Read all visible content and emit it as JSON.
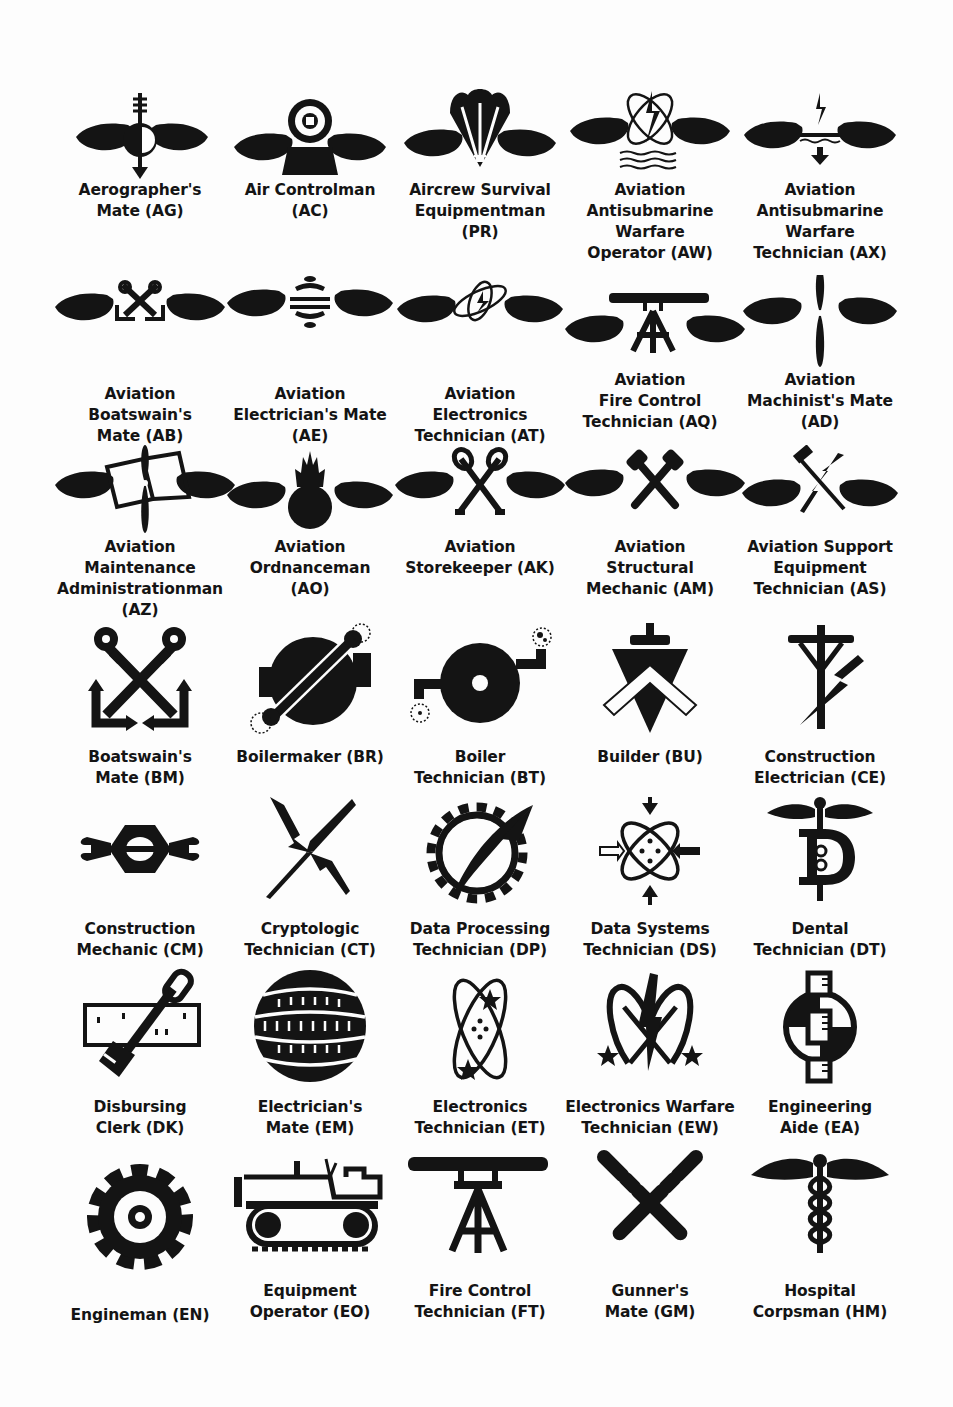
{
  "page": {
    "background": "#fdfdfd",
    "ink": "#141414",
    "rows": [
      {
        "items": [
          {
            "icon": "aerographers-mate-icon",
            "label": "Aerographer's\nMate (AG)",
            "rating": "AG"
          },
          {
            "icon": "air-controlman-icon",
            "label": "Air Controlman\n(AC)",
            "rating": "AC"
          },
          {
            "icon": "aircrew-survival-equipmentman-icon",
            "label": "Aircrew Survival\nEquipmentman\n(PR)",
            "rating": "PR"
          },
          {
            "icon": "aviation-antisubmarine-warfare-operator-icon",
            "label": "Aviation\nAntisubmarine\nWarfare\nOperator (AW)",
            "rating": "AW"
          },
          {
            "icon": "aviation-antisubmarine-warfare-technician-icon",
            "label": "Aviation\nAntisubmarine\nWarfare\nTechnician (AX)",
            "rating": "AX"
          }
        ]
      },
      {
        "items": [
          {
            "icon": "aviation-boatswains-mate-icon",
            "label": "Aviation\nBoatswain's\nMate (AB)",
            "rating": "AB"
          },
          {
            "icon": "aviation-electricians-mate-icon",
            "label": "Aviation\nElectrician's Mate\n(AE)",
            "rating": "AE"
          },
          {
            "icon": "aviation-electronics-technician-icon",
            "label": "Aviation\nElectronics\nTechnician (AT)",
            "rating": "AT"
          },
          {
            "icon": "aviation-fire-control-technician-icon",
            "label": "Aviation\nFire Control\nTechnician (AQ)",
            "rating": "AQ"
          },
          {
            "icon": "aviation-machinists-mate-icon",
            "label": "Aviation\nMachinist's Mate\n(AD)",
            "rating": "AD"
          }
        ]
      },
      {
        "items": [
          {
            "icon": "aviation-maintenance-administrationman-icon",
            "label": "Aviation\nMaintenance\nAdministrationman\n(AZ)",
            "rating": "AZ"
          },
          {
            "icon": "aviation-ordnanceman-icon",
            "label": "Aviation\nOrdnanceman\n(AO)",
            "rating": "AO"
          },
          {
            "icon": "aviation-storekeeper-icon",
            "label": "Aviation\nStorekeeper (AK)",
            "rating": "AK"
          },
          {
            "icon": "aviation-structural-mechanic-icon",
            "label": "Aviation\nStructural\nMechanic (AM)",
            "rating": "AM"
          },
          {
            "icon": "aviation-support-equipment-technician-icon",
            "label": "Aviation Support\nEquipment\nTechnician (AS)",
            "rating": "AS"
          }
        ]
      },
      {
        "items": [
          {
            "icon": "boatswains-mate-icon",
            "label": "Boatswain's\nMate (BM)",
            "rating": "BM"
          },
          {
            "icon": "boilermaker-icon",
            "label": "Boilermaker (BR)",
            "rating": "BR"
          },
          {
            "icon": "boiler-technician-icon",
            "label": "Boiler\nTechnician (BT)",
            "rating": "BT"
          },
          {
            "icon": "builder-icon",
            "label": "Builder (BU)",
            "rating": "BU"
          },
          {
            "icon": "construction-electrician-icon",
            "label": "Construction\nElectrician (CE)",
            "rating": "CE"
          }
        ]
      },
      {
        "items": [
          {
            "icon": "construction-mechanic-icon",
            "label": "Construction\nMechanic (CM)",
            "rating": "CM"
          },
          {
            "icon": "cryptologic-technician-icon",
            "label": "Cryptologic\nTechnician (CT)",
            "rating": "CT"
          },
          {
            "icon": "data-processing-technician-icon",
            "label": "Data Processing\nTechnician (DP)",
            "rating": "DP"
          },
          {
            "icon": "data-systems-technician-icon",
            "label": "Data Systems\nTechnician (DS)",
            "rating": "DS"
          },
          {
            "icon": "dental-technician-icon",
            "label": "Dental\nTechnician (DT)",
            "rating": "DT"
          }
        ]
      },
      {
        "items": [
          {
            "icon": "disbursing-clerk-icon",
            "label": "Disbursing\nClerk (DK)",
            "rating": "DK"
          },
          {
            "icon": "electricians-mate-icon",
            "label": "Electrician's\nMate (EM)",
            "rating": "EM"
          },
          {
            "icon": "electronics-technician-icon",
            "label": "Electronics\nTechnician (ET)",
            "rating": "ET"
          },
          {
            "icon": "electronics-warfare-technician-icon",
            "label": "Electronics Warfare\nTechnician (EW)",
            "rating": "EW"
          },
          {
            "icon": "engineering-aide-icon",
            "label": "Engineering\nAide (EA)",
            "rating": "EA"
          }
        ]
      },
      {
        "items": [
          {
            "icon": "engineman-icon",
            "label": "Engineman (EN)",
            "rating": "EN"
          },
          {
            "icon": "equipment-operator-icon",
            "label": "Equipment\nOperator (EO)",
            "rating": "EO"
          },
          {
            "icon": "fire-control-technician-icon",
            "label": "Fire Control\nTechnician (FT)",
            "rating": "FT"
          },
          {
            "icon": "gunners-mate-icon",
            "label": "Gunner's\nMate (GM)",
            "rating": "GM"
          },
          {
            "icon": "hospital-corpsman-icon",
            "label": "Hospital\nCorpsman (HM)",
            "rating": "HM"
          }
        ]
      }
    ]
  }
}
